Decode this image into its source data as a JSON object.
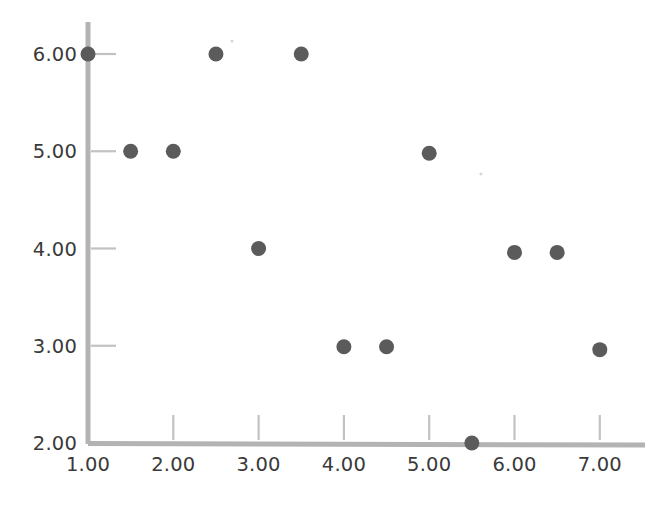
{
  "chart_data": {
    "type": "scatter",
    "title": "",
    "subtitle": "",
    "xlabel": "",
    "ylabel": "",
    "xlim": [
      0.75,
      7.6
    ],
    "ylim": [
      2.0,
      6.35
    ],
    "grid": false,
    "legend": null,
    "x_ticks": [
      1.0,
      2.0,
      3.0,
      4.0,
      5.0,
      6.0,
      7.0
    ],
    "y_ticks": [
      2.0,
      3.0,
      4.0,
      5.0,
      6.0
    ],
    "x_tick_labels": [
      "1.00",
      "2.00",
      "3.00",
      "4.00",
      "5.00",
      "6.00",
      "7.00"
    ],
    "y_tick_labels": [
      "2.00",
      "3.00",
      "4.00",
      "5.00",
      "6.00"
    ],
    "marker": {
      "shape": "circle",
      "color": "#5b5b5b",
      "radius_px": 7.5
    },
    "series": [
      {
        "name": "series-1",
        "color": "#5b5b5b",
        "points": [
          {
            "x": 1.0,
            "y": 6.0
          },
          {
            "x": 2.5,
            "y": 6.0
          },
          {
            "x": 3.5,
            "y": 6.0
          },
          {
            "x": 1.5,
            "y": 5.0
          },
          {
            "x": 2.0,
            "y": 5.0
          },
          {
            "x": 5.0,
            "y": 4.98
          },
          {
            "x": 3.0,
            "y": 4.0
          },
          {
            "x": 6.0,
            "y": 3.96
          },
          {
            "x": 6.5,
            "y": 3.96
          },
          {
            "x": 4.0,
            "y": 2.99
          },
          {
            "x": 4.5,
            "y": 2.99
          },
          {
            "x": 7.0,
            "y": 2.96
          },
          {
            "x": 5.5,
            "y": 2.0
          }
        ]
      }
    ]
  },
  "colors": {
    "marker": "#5b5b5b",
    "axis": "#b3b3b3",
    "tick": "#c2c2c2",
    "label_text": "#3a3a3a",
    "background": "#ffffff"
  },
  "geometry": {
    "origin_x_px": 88,
    "origin_y_px": 443,
    "px_per_x_unit": 85.3,
    "px_per_y_unit": 97.25,
    "x_axis_right_px": 645,
    "y_axis_top_px": 22
  }
}
